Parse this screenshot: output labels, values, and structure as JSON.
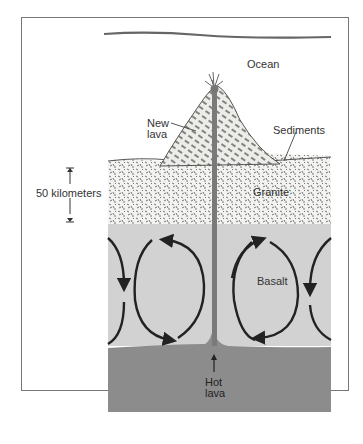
{
  "diagram": {
    "labels": {
      "ocean": "Ocean",
      "new_lava_line1": "New",
      "new_lava_line2": "lava",
      "sediments": "Sediments",
      "granite": "Granite",
      "basalt": "Basalt",
      "scale": "50 kilometers",
      "hot_lava_line1": "Hot",
      "hot_lava_line2": "lava"
    },
    "colors": {
      "ocean_line": "#666666",
      "granite_bg": "#f4f4f2",
      "basalt": "#d2d2d2",
      "hot_lava": "#8c8c8c",
      "conduit": "#7a7a7a",
      "arrows": "#222222",
      "frame": "#777777"
    }
  }
}
